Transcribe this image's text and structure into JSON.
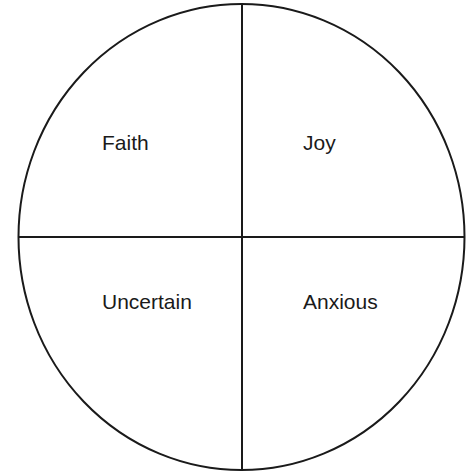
{
  "diagram": {
    "type": "quadrant-circle",
    "stroke_color": "#1a1a1a",
    "background": "#ffffff",
    "quadrants": [
      {
        "position": "top-left",
        "label": "Faith"
      },
      {
        "position": "top-right",
        "label": "Joy"
      },
      {
        "position": "bottom-left",
        "label": "Uncertain"
      },
      {
        "position": "bottom-right",
        "label": "Anxious"
      }
    ]
  }
}
